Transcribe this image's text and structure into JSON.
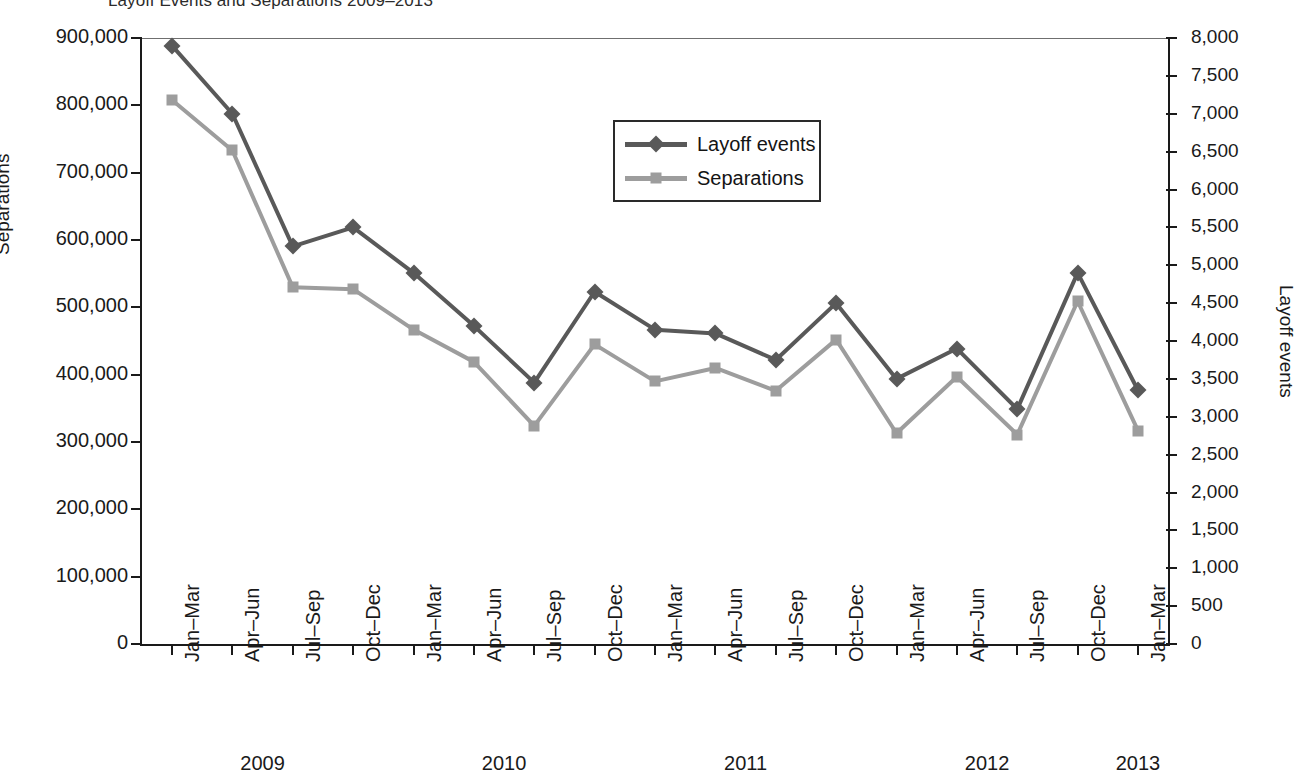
{
  "title": "Layoff Events and Separations 2009–2013",
  "legend": {
    "position": "inside-top-center",
    "items": [
      {
        "label": "Layoff events",
        "marker": "diamond",
        "color": "#595959"
      },
      {
        "label": "Separations",
        "marker": "square",
        "color": "#9d9d9d"
      }
    ]
  },
  "axes": {
    "left": {
      "title": "Separations",
      "ticks": [
        "0",
        "100,000",
        "200,000",
        "300,000",
        "400,000",
        "500,000",
        "600,000",
        "700,000",
        "800,000",
        "900,000"
      ],
      "min": 0,
      "max": 900000,
      "step": 100000
    },
    "right": {
      "title": "Layoff events",
      "ticks": [
        "0",
        "500",
        "1,000",
        "1,500",
        "2,000",
        "2,500",
        "3,000",
        "3,500",
        "4,000",
        "4,500",
        "5,000",
        "5,500",
        "6,000",
        "6,500",
        "7,000",
        "7,500",
        "8,000"
      ],
      "min": 0,
      "max": 8000,
      "step": 500
    },
    "bottom": {
      "quarters": [
        "Jan–Mar",
        "Apr–Jun",
        "Jul–Sep",
        "Oct–Dec",
        "Jan–Mar",
        "Apr–Jun",
        "Jul–Sep",
        "Oct–Dec",
        "Jan–Mar",
        "Apr–Jun",
        "Jul–Sep",
        "Oct–Dec",
        "Jan–Mar",
        "Apr–Jun",
        "Jul–Sep",
        "Oct–Dec",
        "Jan–Mar"
      ],
      "years": [
        {
          "label": "2009",
          "first_index": 0,
          "count": 4
        },
        {
          "label": "2010",
          "first_index": 4,
          "count": 4
        },
        {
          "label": "2011",
          "first_index": 8,
          "count": 4
        },
        {
          "label": "2012",
          "first_index": 12,
          "count": 4
        },
        {
          "label": "2013",
          "first_index": 16,
          "count": 1
        }
      ]
    }
  },
  "chart_data": {
    "type": "line",
    "title": "Layoff Events and Separations 2009–2013",
    "xlabel": "",
    "ylabel": "Separations",
    "y2label": "Layoff events",
    "ylim": [
      0,
      900000
    ],
    "y2lim": [
      0,
      8000
    ],
    "grid": false,
    "legend_position": "inside-top-center",
    "categories": [
      "2009 Jan–Mar",
      "2009 Apr–Jun",
      "2009 Jul–Sep",
      "2009 Oct–Dec",
      "2010 Jan–Mar",
      "2010 Apr–Jun",
      "2010 Jul–Sep",
      "2010 Oct–Dec",
      "2011 Jan–Mar",
      "2011 Apr–Jun",
      "2011 Jul–Sep",
      "2011 Oct–Dec",
      "2012 Jan–Mar",
      "2012 Apr–Jun",
      "2012 Jul–Sep",
      "2012 Oct–Dec",
      "2013 Jan–Mar"
    ],
    "series": [
      {
        "name": "Layoff events",
        "axis": "right",
        "units": "events",
        "color": "#595959",
        "marker": "diamond",
        "values": [
          7900,
          7000,
          5250,
          5500,
          4900,
          4200,
          3450,
          4650,
          4150,
          4100,
          3750,
          4500,
          3500,
          3900,
          3100,
          4900,
          3350
        ]
      },
      {
        "name": "Separations",
        "axis": "left",
        "units": "separations",
        "color": "#9d9d9d",
        "marker": "square",
        "values": [
          808000,
          733000,
          530000,
          527000,
          467000,
          419000,
          324000,
          445000,
          390000,
          410000,
          376000,
          452000,
          313000,
          397000,
          311000,
          509000,
          317000
        ]
      }
    ]
  }
}
